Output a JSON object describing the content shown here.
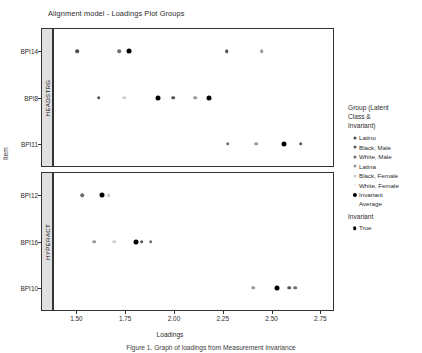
{
  "chart_data": {
    "type": "scatter",
    "title": "Alignment model - Loadings Plot Groups",
    "xlabel": "Loadings",
    "ylabel": "Item",
    "xlim": [
      1.38,
      2.82
    ],
    "xticks": [
      "1.50",
      "1.75",
      "2.00",
      "2.25",
      "2.50",
      "2.75"
    ],
    "xtickvalues": [
      1.5,
      1.75,
      2.0,
      2.25,
      2.5,
      2.75
    ],
    "grid": false,
    "legend_position": "right",
    "facets": [
      {
        "strip_label": "HEADSTRG",
        "items": [
          "BPI14",
          "BPI8",
          "BPI11"
        ],
        "points": [
          {
            "item": "BPI14",
            "group": "Latino",
            "x": 1.505
          },
          {
            "item": "BPI14",
            "group": "White, Male",
            "x": 1.72
          },
          {
            "item": "BPI14",
            "group": "Invariant Average",
            "x": 1.77
          },
          {
            "item": "BPI14",
            "group": "Black, Male",
            "x": 2.27
          },
          {
            "item": "BPI14",
            "group": "Latina",
            "x": 2.45
          },
          {
            "item": "BPI8",
            "group": "Latino",
            "x": 1.615
          },
          {
            "item": "BPI8",
            "group": "Black, Female",
            "x": 1.745
          },
          {
            "item": "BPI8",
            "group": "Invariant Average",
            "x": 1.92
          },
          {
            "item": "BPI8",
            "group": "Black, Male",
            "x": 1.995
          },
          {
            "item": "BPI8",
            "group": "Latina",
            "x": 2.11
          },
          {
            "item": "BPI8",
            "group": "Invariant Average",
            "x": 2.18
          },
          {
            "item": "BPI11",
            "group": "White, Male",
            "x": 2.275
          },
          {
            "item": "BPI11",
            "group": "Latina",
            "x": 2.42
          },
          {
            "item": "BPI11",
            "group": "Invariant Average",
            "x": 2.565
          },
          {
            "item": "BPI11",
            "group": "Black, Male",
            "x": 2.65
          },
          {
            "item": "BPI11",
            "group": "White, Female",
            "x": 2.87
          }
        ]
      },
      {
        "strip_label": "HYPERACT",
        "items": [
          "BPI12",
          "BPI16",
          "BPI10"
        ],
        "points": [
          {
            "item": "BPI12",
            "group": "White, Male",
            "x": 1.53
          },
          {
            "item": "BPI12",
            "group": "Invariant Average",
            "x": 1.63
          },
          {
            "item": "BPI12",
            "group": "Black, Female",
            "x": 1.665
          },
          {
            "item": "BPI16",
            "group": "Latina",
            "x": 1.59
          },
          {
            "item": "BPI16",
            "group": "Black, Female",
            "x": 1.695
          },
          {
            "item": "BPI16",
            "group": "Invariant Average",
            "x": 1.805
          },
          {
            "item": "BPI16",
            "group": "Black, Male",
            "x": 1.835
          },
          {
            "item": "BPI16",
            "group": "White, Male",
            "x": 1.88
          },
          {
            "item": "BPI10",
            "group": "Latina",
            "x": 2.405
          },
          {
            "item": "BPI10",
            "group": "Invariant Average",
            "x": 2.53
          },
          {
            "item": "BPI10",
            "group": "Black, Male",
            "x": 2.59
          },
          {
            "item": "BPI10",
            "group": "White, Male",
            "x": 2.62
          }
        ]
      }
    ],
    "group_colors": {
      "Latino": "#4d4d4d",
      "Black, Male": "#555555",
      "White, Male": "#6e6e6e",
      "Latina": "#9a9a9a",
      "Black, Female": "#cfcfcf",
      "White, Female": "#ededed",
      "Invariant Average": "#000000"
    }
  },
  "legend": {
    "title_line1": "Group (Latent",
    "title_line2": "Class &",
    "title_line3": "Invariant)",
    "entries": [
      {
        "label": "Latino",
        "color": "#4d4d4d",
        "size": 3.0
      },
      {
        "label": "Black, Male",
        "color": "#555555",
        "size": 3.0
      },
      {
        "label": "White, Male",
        "color": "#6e6e6e",
        "size": 3.0
      },
      {
        "label": "Latina",
        "color": "#9a9a9a",
        "size": 3.0
      },
      {
        "label": "Black, Female",
        "color": "#cfcfcf",
        "size": 3.0
      },
      {
        "label": "White, Female",
        "color": "#f2f2f2",
        "size": 3.0
      }
    ],
    "average_entry": {
      "label_line1": "Invariant",
      "label_line2": "Average",
      "color": "#000000",
      "size": 4.2
    },
    "title2": "Invariant",
    "entries2": [
      {
        "label": "True",
        "color": "#000000",
        "size": 3.6
      }
    ]
  },
  "caption": {
    "text": "Figure 1. Graph of loadings from Measurement Invariance"
  }
}
